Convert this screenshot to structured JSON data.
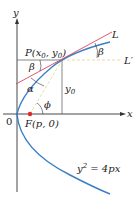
{
  "diagram": {
    "axes": {
      "x_label": "x",
      "y_label": "y",
      "origin_label": "0"
    },
    "point_p": {
      "label": "P(x",
      "sub0": "0",
      "mid": ", y",
      "sub1": "0",
      "end": ")"
    },
    "focus": {
      "label": "F(p, 0)"
    },
    "lines": {
      "tangent": "L",
      "horizontal": "L′"
    },
    "angles": {
      "beta_top": "β",
      "beta_left": "β",
      "alpha": "α",
      "phi": "ϕ"
    },
    "y0": {
      "label": "y",
      "sub": "0"
    },
    "equation": {
      "lhs": "y",
      "exp": "2",
      "rhs": " = 4px"
    },
    "colors": {
      "parabola": "#3a7fc4",
      "tangent": "#e0455a",
      "focus": "#e02a2a",
      "dashed": "#e8d79a",
      "axis": "#333333"
    }
  }
}
